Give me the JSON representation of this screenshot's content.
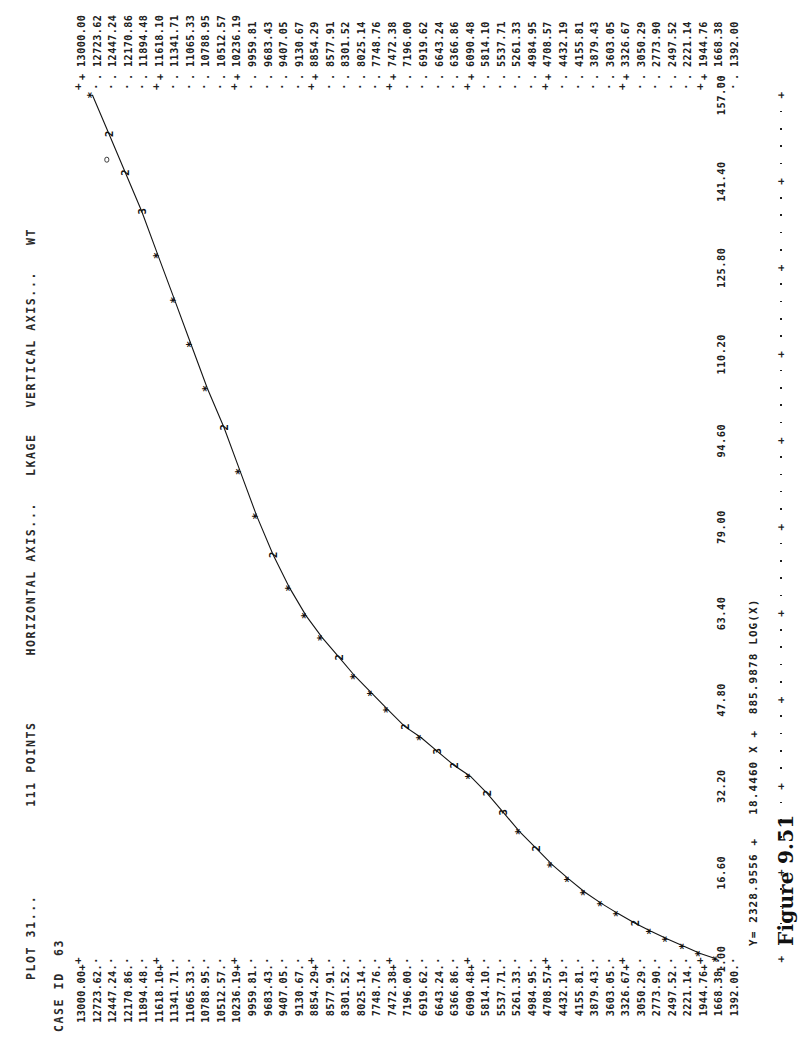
{
  "report": {
    "plot_label": "PLOT 31...",
    "points_label": "111 POINTS",
    "horizontal_axis_label": "HORIZONTAL AXIS...",
    "horizontal_axis_name": "LKAGE",
    "vertical_axis_label": "VERTICAL AXIS...",
    "vertical_axis_name": "WT",
    "case_id_label": "CASE ID",
    "case_id_value": "63",
    "equation": "Y= 2328.9556 +   18.4460 X +  885.9878 LOG(X)",
    "figure_caption": "Figure 9.51"
  },
  "chart_data": {
    "type": "line",
    "title": "PLOT 31...",
    "subtitle": "111 POINTS",
    "xlabel": "LKAGE",
    "ylabel": "WT",
    "grid": false,
    "legend": "none",
    "xlim": [
      1.0,
      157.0
    ],
    "ylim": [
      1392.0,
      13000.0
    ],
    "xtick_labels": [
      "1.00",
      "16.60",
      "32.20",
      "47.80",
      "63.40",
      "79.00",
      "94.60",
      "110.20",
      "125.80",
      "141.40",
      "157.00"
    ],
    "xtick_values": [
      1.0,
      16.6,
      32.2,
      47.8,
      63.4,
      79.0,
      94.6,
      110.2,
      125.8,
      141.4,
      157.0
    ],
    "ytick_labels": [
      "13000.00",
      "12723.62",
      "12447.24",
      "12170.86",
      "11894.48",
      "11618.10",
      "11341.71",
      "11065.33",
      "10788.95",
      "10512.57",
      "10236.19",
      "9959.81",
      "9683.43",
      "9407.05",
      "9130.67",
      "8854.29",
      "8577.91",
      "8301.52",
      "8025.14",
      "7748.76",
      "7472.38",
      "7196.00",
      "6919.62",
      "6643.24",
      "6366.86",
      "6090.48",
      "5814.10",
      "5537.71",
      "5261.33",
      "4984.95",
      "4708.57",
      "4432.19",
      "4155.81",
      "3879.43",
      "3603.05",
      "3326.67",
      "3050.29",
      "2773.90",
      "2497.52",
      "2221.14",
      "1944.76",
      "1668.38",
      "1392.00"
    ],
    "ytick_major_flags": [
      true,
      false,
      false,
      false,
      false,
      true,
      false,
      false,
      false,
      false,
      true,
      false,
      false,
      false,
      false,
      true,
      false,
      false,
      false,
      false,
      true,
      false,
      false,
      false,
      false,
      true,
      false,
      false,
      false,
      false,
      true,
      false,
      false,
      false,
      false,
      true,
      false,
      false,
      false,
      false,
      true,
      false,
      false
    ],
    "marker_glyph": "*",
    "overlap_glyphs_note": "digits 2/3 mark coincident points",
    "fit_equation": {
      "intercept": 2328.9556,
      "x_coefficient": 18.446,
      "log_x_coefficient": 885.9878,
      "form": "Y = a + b*X + c*LOG(X)"
    },
    "points": [
      {
        "x": 1.0,
        "y": 2221.14,
        "glyph": "*"
      },
      {
        "x": 2.0,
        "y": 2497.52,
        "glyph": "*"
      },
      {
        "x": 3.3,
        "y": 2773.9,
        "glyph": "*"
      },
      {
        "x": 4.6,
        "y": 3050.29,
        "glyph": "*"
      },
      {
        "x": 6.0,
        "y": 3326.67,
        "glyph": "*"
      },
      {
        "x": 7.5,
        "y": 3603.05,
        "glyph": "2"
      },
      {
        "x": 9.2,
        "y": 3879.43,
        "glyph": "*"
      },
      {
        "x": 11.0,
        "y": 4155.81,
        "glyph": "*"
      },
      {
        "x": 13.0,
        "y": 4432.19,
        "glyph": "*"
      },
      {
        "x": 15.4,
        "y": 4708.57,
        "glyph": "*"
      },
      {
        "x": 18.0,
        "y": 4984.95,
        "glyph": "*"
      },
      {
        "x": 21.0,
        "y": 5261.33,
        "glyph": "2"
      },
      {
        "x": 24.0,
        "y": 5537.71,
        "glyph": "*"
      },
      {
        "x": 27.5,
        "y": 5814.1,
        "glyph": "3"
      },
      {
        "x": 31.0,
        "y": 6090.48,
        "glyph": "2"
      },
      {
        "x": 34.0,
        "y": 6366.86,
        "glyph": "*"
      },
      {
        "x": 36.0,
        "y": 6643.24,
        "glyph": "2"
      },
      {
        "x": 38.5,
        "y": 6919.62,
        "glyph": "3"
      },
      {
        "x": 41.0,
        "y": 7196.0,
        "glyph": "*"
      },
      {
        "x": 43.0,
        "y": 7472.38,
        "glyph": "2"
      },
      {
        "x": 46.0,
        "y": 7748.76,
        "glyph": "*"
      },
      {
        "x": 49.0,
        "y": 8025.14,
        "glyph": "*"
      },
      {
        "x": 52.0,
        "y": 8301.52,
        "glyph": "*"
      },
      {
        "x": 55.5,
        "y": 8577.91,
        "glyph": "2"
      },
      {
        "x": 59.0,
        "y": 8854.29,
        "glyph": "*"
      },
      {
        "x": 63.0,
        "y": 9130.67,
        "glyph": "*"
      },
      {
        "x": 68.0,
        "y": 9407.05,
        "glyph": "*"
      },
      {
        "x": 74.0,
        "y": 9683.43,
        "glyph": "2"
      },
      {
        "x": 81.0,
        "y": 9959.81,
        "glyph": "*"
      },
      {
        "x": 89.0,
        "y": 10236.19,
        "glyph": "*"
      },
      {
        "x": 97.0,
        "y": 10512.57,
        "glyph": "2"
      },
      {
        "x": 104.0,
        "y": 10788.95,
        "glyph": "*"
      },
      {
        "x": 112.0,
        "y": 11065.33,
        "glyph": "*"
      },
      {
        "x": 120.0,
        "y": 11341.71,
        "glyph": "*"
      },
      {
        "x": 128.0,
        "y": 11618.1,
        "glyph": "*"
      },
      {
        "x": 136.0,
        "y": 11894.48,
        "glyph": "3"
      },
      {
        "x": 143.0,
        "y": 12170.86,
        "glyph": "2"
      },
      {
        "x": 150.0,
        "y": 12447.24,
        "glyph": "2"
      },
      {
        "x": 157.0,
        "y": 12723.62,
        "glyph": "*"
      }
    ],
    "outliers": [
      {
        "x": 150.0,
        "y": 12447.24
      }
    ]
  }
}
